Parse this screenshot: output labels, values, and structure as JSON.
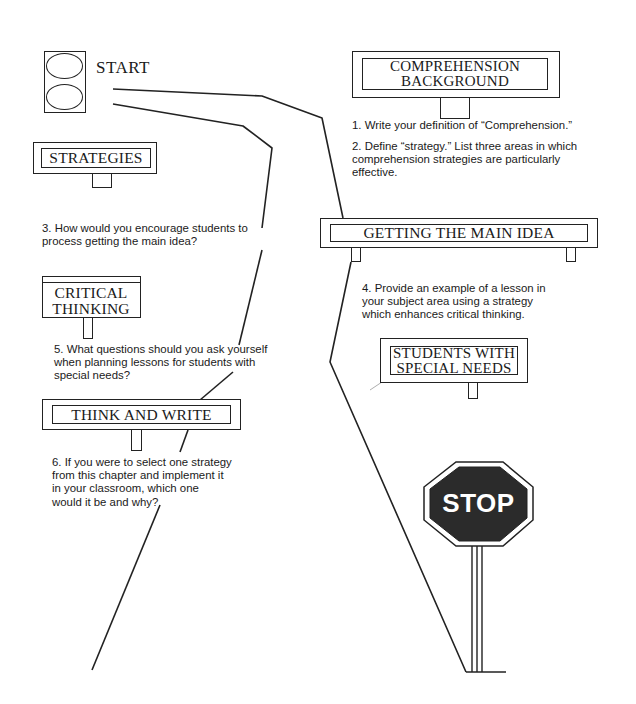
{
  "diagram": {
    "type": "road-map-worksheet",
    "start": {
      "label": "START"
    },
    "signs": [
      {
        "id": "comprehension-background",
        "lines": [
          "COMPREHENSION",
          "BACKGROUND"
        ]
      },
      {
        "id": "strategies",
        "lines": [
          "STRATEGIES"
        ]
      },
      {
        "id": "getting-main-idea",
        "lines": [
          "GETTING THE MAIN IDEA"
        ]
      },
      {
        "id": "critical-thinking",
        "lines": [
          "CRITICAL",
          "THINKING"
        ]
      },
      {
        "id": "students-special-needs",
        "lines": [
          "STUDENTS WITH",
          "SPECIAL NEEDS"
        ]
      },
      {
        "id": "think-and-write",
        "lines": [
          "THINK AND WRITE"
        ]
      }
    ],
    "questions": [
      {
        "num": "1.",
        "text": "1. Write your definition of “Comprehension.”"
      },
      {
        "num": "2.",
        "lines": [
          "2. Define “strategy.” List three areas in which",
          "comprehension strategies are particularly",
          "effective."
        ]
      },
      {
        "num": "3.",
        "lines": [
          "3. How would you encourage students to",
          "process getting the main idea?"
        ]
      },
      {
        "num": "4.",
        "lines": [
          "4. Provide an example of a lesson in",
          "your subject area using a strategy",
          "which enhances critical thinking."
        ]
      },
      {
        "num": "5.",
        "lines": [
          "5. What questions should you ask yourself",
          "when planning lessons for students with",
          "special needs?"
        ]
      },
      {
        "num": "6.",
        "lines": [
          "6. If you were to select one strategy",
          "from this chapter and implement it",
          "in your classroom, which one",
          "would it be and why?"
        ]
      }
    ],
    "stop_sign": {
      "label": "STOP",
      "fill": "#2b2b2b",
      "text_color": "#ffffff"
    },
    "colors": {
      "ink": "#1a1a1a",
      "background": "#ffffff"
    }
  }
}
